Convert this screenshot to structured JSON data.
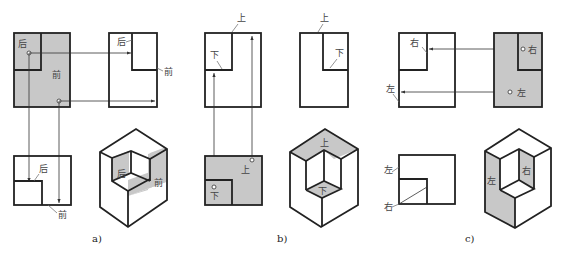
{
  "figure": {
    "panels": [
      {
        "caption": "a)",
        "labels": {
          "back": "后",
          "front": "前"
        }
      },
      {
        "caption": "b)",
        "labels": {
          "top": "上",
          "bottom": "下"
        }
      },
      {
        "caption": "c)",
        "labels": {
          "right": "右",
          "left": "左"
        }
      }
    ],
    "colors": {
      "shade": "#c8c8c8",
      "line": "#222222",
      "background": "#ffffff"
    }
  }
}
